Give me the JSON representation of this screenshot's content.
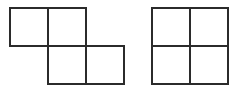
{
  "canvas": {
    "width": 245,
    "height": 86,
    "background_color": "#ffffff"
  },
  "style": {
    "stroke_color": "#2b2b2b",
    "stroke_width": 2,
    "cell_fill": "#ffffff"
  },
  "figures": [
    {
      "id": "left-figure",
      "name": "s-tetromino",
      "description": "Four unit squares arranged in an S/Z offset shape: two squares on the upper-left row and two squares on the lower-right row, overlapping by one column.",
      "cell_size": 38,
      "origin_x": 10,
      "origin_y": 8,
      "grid_cells": [
        {
          "col": 0,
          "row": 0
        },
        {
          "col": 1,
          "row": 0
        },
        {
          "col": 1,
          "row": 1
        },
        {
          "col": 2,
          "row": 1
        }
      ],
      "cell_rects": [
        {
          "x": 10,
          "y": 8,
          "w": 38,
          "h": 38
        },
        {
          "x": 48,
          "y": 8,
          "w": 38,
          "h": 38
        },
        {
          "x": 48,
          "y": 46,
          "w": 38,
          "h": 38
        },
        {
          "x": 86,
          "y": 46,
          "w": 38,
          "h": 38
        }
      ],
      "bounds": {
        "x": 10,
        "y": 8,
        "w": 114,
        "h": 76
      }
    },
    {
      "id": "right-figure",
      "name": "o-tetromino-square",
      "description": "Four unit squares arranged in a 2 by 2 square block.",
      "cell_size": 38,
      "origin_x": 152,
      "origin_y": 8,
      "grid_cells": [
        {
          "col": 0,
          "row": 0
        },
        {
          "col": 1,
          "row": 0
        },
        {
          "col": 0,
          "row": 1
        },
        {
          "col": 1,
          "row": 1
        }
      ],
      "cell_rects": [
        {
          "x": 152,
          "y": 8,
          "w": 38,
          "h": 38
        },
        {
          "x": 190,
          "y": 8,
          "w": 38,
          "h": 38
        },
        {
          "x": 152,
          "y": 46,
          "w": 38,
          "h": 38
        },
        {
          "x": 190,
          "y": 46,
          "w": 38,
          "h": 38
        }
      ],
      "bounds": {
        "x": 152,
        "y": 8,
        "w": 76,
        "h": 76
      }
    }
  ]
}
